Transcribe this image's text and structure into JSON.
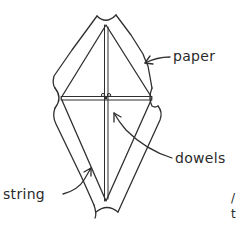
{
  "figure": {
    "labels": {
      "paper": "paper",
      "dowels": "dowels",
      "string": "string"
    },
    "edge_text": {
      "line1": "/",
      "line2": "t"
    },
    "colors": {
      "line": "#2f2f2f",
      "background": "#ffffff"
    }
  }
}
